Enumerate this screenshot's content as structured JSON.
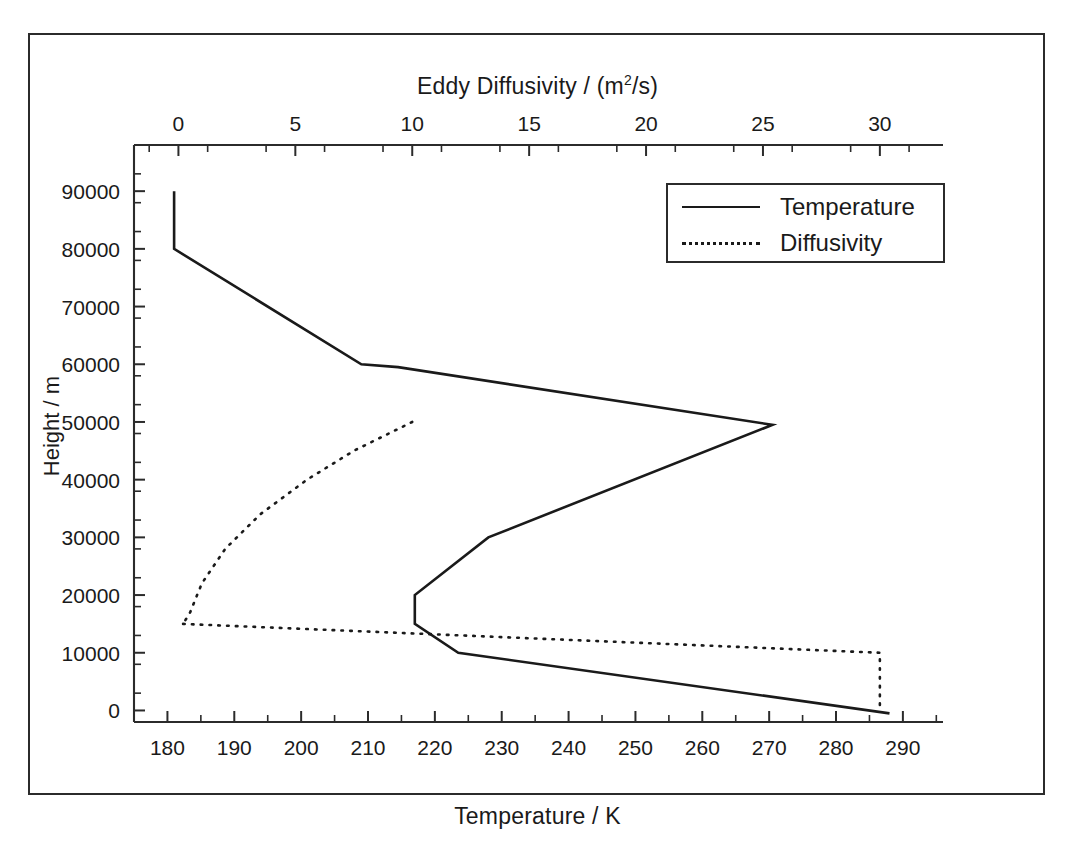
{
  "figure": {
    "top_axis_title_prefix": "Eddy Diffusivity / (m",
    "top_axis_title_sup": "2",
    "top_axis_title_suffix": "/s)",
    "bottom_axis_title": "Temperature / K",
    "y_axis_title": "Height / m"
  },
  "legend": {
    "position": "upper-right",
    "items": [
      {
        "label": "Temperature",
        "style": "solid",
        "icon": "solid-line-icon"
      },
      {
        "label": "Diffusivity",
        "style": "dotted",
        "icon": "dotted-line-icon"
      }
    ]
  },
  "chart_data": {
    "type": "line",
    "title": "Eddy Diffusivity / (m2/s)",
    "subtitle": "",
    "grid": false,
    "legend_position": "upper-right",
    "xlabel": "Temperature / K",
    "ylabel": "Height / m",
    "ylim": [
      -2000,
      98000
    ],
    "y_ticks": [
      0,
      10000,
      20000,
      30000,
      40000,
      50000,
      60000,
      70000,
      80000,
      90000
    ],
    "y_tick_labels": [
      "0",
      "10000",
      "20000",
      "30000",
      "40000",
      "50000",
      "60000",
      "70000",
      "80000",
      "90000"
    ],
    "y_minor_step": 5000,
    "bottom_axis": {
      "label": "Temperature / K",
      "unit": "K",
      "xlim": [
        175,
        296
      ],
      "ticks": [
        180,
        190,
        200,
        210,
        220,
        230,
        240,
        250,
        260,
        270,
        280,
        290
      ],
      "tick_labels": [
        "180",
        "190",
        "200",
        "210",
        "220",
        "230",
        "240",
        "250",
        "260",
        "270",
        "280",
        "290"
      ],
      "minor_step": 5
    },
    "top_axis": {
      "label": "Eddy Diffusivity / (m2/s)",
      "unit": "m2/s",
      "xlim": [
        -1.9,
        32.7
      ],
      "ticks": [
        0,
        5,
        10,
        15,
        20,
        25,
        30
      ],
      "tick_labels": [
        "0",
        "5",
        "10",
        "15",
        "20",
        "25",
        "30"
      ],
      "minor_step": 2.5
    },
    "series": [
      {
        "name": "Temperature",
        "style": "solid",
        "x_axis": "bottom",
        "xlabel": "Temperature / K",
        "points": [
          {
            "temperature_K": 181.0,
            "height_m": 90000
          },
          {
            "temperature_K": 181.0,
            "height_m": 80000
          },
          {
            "temperature_K": 209.0,
            "height_m": 60000
          },
          {
            "temperature_K": 214.5,
            "height_m": 59500
          },
          {
            "temperature_K": 270.5,
            "height_m": 49500
          },
          {
            "temperature_K": 228.0,
            "height_m": 30000
          },
          {
            "temperature_K": 217.0,
            "height_m": 20000
          },
          {
            "temperature_K": 217.0,
            "height_m": 15000
          },
          {
            "temperature_K": 223.5,
            "height_m": 10000
          },
          {
            "temperature_K": 288.0,
            "height_m": -500
          }
        ]
      },
      {
        "name": "Diffusivity",
        "style": "dotted",
        "x_axis": "top",
        "xlabel": "Eddy Diffusivity / (m2/s)",
        "points": [
          {
            "diffusivity_m2_s": 0.2,
            "height_m": 50000
          },
          {
            "diffusivity_m2_s": 0.2,
            "height_m": 15000
          },
          {
            "diffusivity_m2_s": 0.5,
            "height_m": 17000
          },
          {
            "diffusivity_m2_s": 1.0,
            "height_m": 22000
          },
          {
            "diffusivity_m2_s": 2.0,
            "height_m": 28000
          },
          {
            "diffusivity_m2_s": 3.5,
            "height_m": 34000
          },
          {
            "diffusivity_m2_s": 5.5,
            "height_m": 40000
          },
          {
            "diffusivity_m2_s": 7.5,
            "height_m": 45000
          },
          {
            "diffusivity_m2_s": 10.0,
            "height_m": 50000
          },
          {
            "diffusivity_m2_s": 0.2,
            "height_m": 15000
          },
          {
            "diffusivity_m2_s": 30.0,
            "height_m": 10000
          },
          {
            "diffusivity_m2_s": 30.0,
            "height_m": 0
          }
        ],
        "segments": [
          {
            "name": "upper-branch",
            "description": "Rises from tropopause to 50 km reaching 10 m2/s",
            "points": [
              [
                0.2,
                50000
              ],
              [
                0.2,
                15000
              ]
            ]
          }
        ]
      }
    ],
    "annotations": []
  }
}
